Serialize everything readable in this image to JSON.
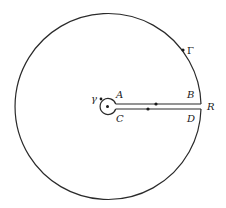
{
  "diagram": {
    "type": "keyhole-contour",
    "stroke_color": "#2a2a2a",
    "background": "#ffffff",
    "labels": {
      "gamma_big": "Γ",
      "gamma_small": "γ",
      "A": "A",
      "B": "B",
      "C": "C",
      "D": "D",
      "R": "R"
    },
    "elements": {
      "outer_circle": "Γ",
      "inner_circle": "γ",
      "upper_segment": "A to B",
      "lower_segment": "D to C"
    }
  }
}
